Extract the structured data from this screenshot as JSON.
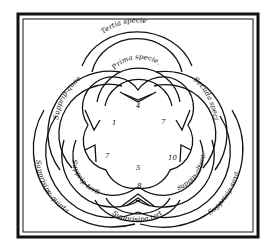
{
  "diagram": {
    "type": "overlapping-circles-woodcut",
    "frame": {
      "style": "double-border",
      "color": "#111111"
    },
    "labels": {
      "top_outer": "Tertia specie",
      "top_inner": "Prima specie.",
      "upper_left": "Supprip-quae.",
      "upper_right": "Secūda specie.",
      "lower_left_inner": "Supprip-tertia.",
      "lower_right_inner": "suppip-altera.",
      "bottom_inner": "Supprisipa.tertia.",
      "lower_left_outer": "Supprisipe-quinta.",
      "lower_right_outer": "Supprisip-sexa."
    },
    "numbers": {
      "top": "4",
      "upper_left": "1",
      "upper_right": "7",
      "left": "7",
      "right": "10",
      "bottom_center": "5",
      "bottom": "8"
    }
  }
}
